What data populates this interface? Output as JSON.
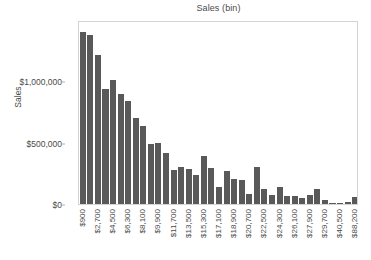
{
  "chart_data": {
    "type": "bar",
    "title": "Sales (bin)",
    "xlabel": "",
    "ylabel": "Sales",
    "ylim": [
      0,
      1500000
    ],
    "grid": false,
    "legend": null,
    "bar_color": "#595959",
    "y_ticks": [
      {
        "value": 0,
        "label": "$0"
      },
      {
        "value": 500000,
        "label": "$500,000"
      },
      {
        "value": 1000000,
        "label": "$1,000,000"
      }
    ],
    "x_tick_labels": [
      "$900",
      "$2,700",
      "$4,500",
      "$6,300",
      "$8,100",
      "$9,900",
      "$11,700",
      "$13,500",
      "$15,300",
      "$17,100",
      "$18,900",
      "$20,700",
      "$22,500",
      "$24,300",
      "$26,100",
      "$27,900",
      "$29,700",
      "$40,500",
      "$88,200"
    ],
    "x_tick_interval": 2,
    "categories": [
      "$900",
      "$1,800",
      "$2,700",
      "$3,600",
      "$4,500",
      "$5,400",
      "$6,300",
      "$7,200",
      "$8,100",
      "$9,000",
      "$9,900",
      "$10,800",
      "$11,700",
      "$12,600",
      "$13,500",
      "$14,400",
      "$15,300",
      "$16,200",
      "$17,100",
      "$18,000",
      "$18,900",
      "$19,800",
      "$20,700",
      "$21,600",
      "$22,500",
      "$23,400",
      "$24,300",
      "$25,200",
      "$26,100",
      "$27,000",
      "$27,900",
      "$28,800",
      "$29,700",
      "$31,500",
      "$40,500",
      "$49,500",
      "$88,200"
    ],
    "values": [
      1400000,
      1380000,
      1215000,
      935000,
      1015000,
      895000,
      840000,
      700000,
      635000,
      490000,
      500000,
      415000,
      275000,
      305000,
      285000,
      240000,
      395000,
      290000,
      135000,
      270000,
      200000,
      195000,
      80000,
      305000,
      125000,
      72000,
      140000,
      65000,
      62000,
      45000,
      70000,
      120000,
      30000,
      8000,
      12000,
      14000,
      55000
    ]
  }
}
